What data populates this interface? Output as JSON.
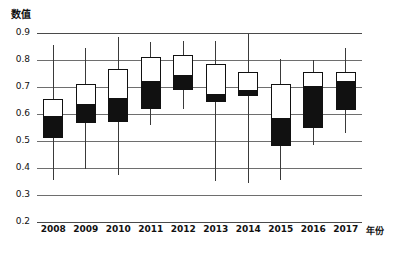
{
  "chart_data": {
    "type": "box",
    "title": "",
    "xlabel": "年份",
    "ylabel": "数值",
    "ylim": [
      0.2,
      0.9
    ],
    "yticks": [
      "0.9",
      "0.8",
      "0.7",
      "0.6",
      "0.5",
      "0.4",
      "0.3",
      "0.2"
    ],
    "ytick_values": [
      0.9,
      0.8,
      0.7,
      0.6,
      0.5,
      0.4,
      0.3,
      0.2
    ],
    "grid": true,
    "legend": "none",
    "categories": [
      "2008",
      "2009",
      "2010",
      "2011",
      "2012",
      "2013",
      "2014",
      "2015",
      "2016",
      "2017"
    ],
    "series": [
      {
        "name": "whisker_high",
        "values": [
          0.855,
          0.845,
          0.885,
          0.865,
          0.87,
          0.87,
          0.895,
          0.805,
          0.8,
          0.845
        ]
      },
      {
        "name": "box_top",
        "values": [
          0.655,
          0.71,
          0.765,
          0.81,
          0.82,
          0.785,
          0.755,
          0.71,
          0.755,
          0.755
        ]
      },
      {
        "name": "median",
        "values": [
          0.59,
          0.635,
          0.655,
          0.72,
          0.74,
          0.67,
          0.685,
          0.58,
          0.7,
          0.72
        ]
      },
      {
        "name": "box_bottom",
        "values": [
          0.51,
          0.565,
          0.57,
          0.62,
          0.69,
          0.645,
          0.665,
          0.48,
          0.55,
          0.615
        ]
      },
      {
        "name": "whisker_low",
        "values": [
          0.355,
          0.395,
          0.375,
          0.56,
          0.62,
          0.35,
          0.345,
          0.355,
          0.485,
          0.53
        ]
      }
    ],
    "colors": {
      "upper_box_fill": "#ffffff",
      "lower_box_fill": "#111111",
      "box_outline": "#111111",
      "whisker": "#3a3a3a",
      "gridline": "#6e6e6e",
      "background": "#ffffff"
    }
  }
}
